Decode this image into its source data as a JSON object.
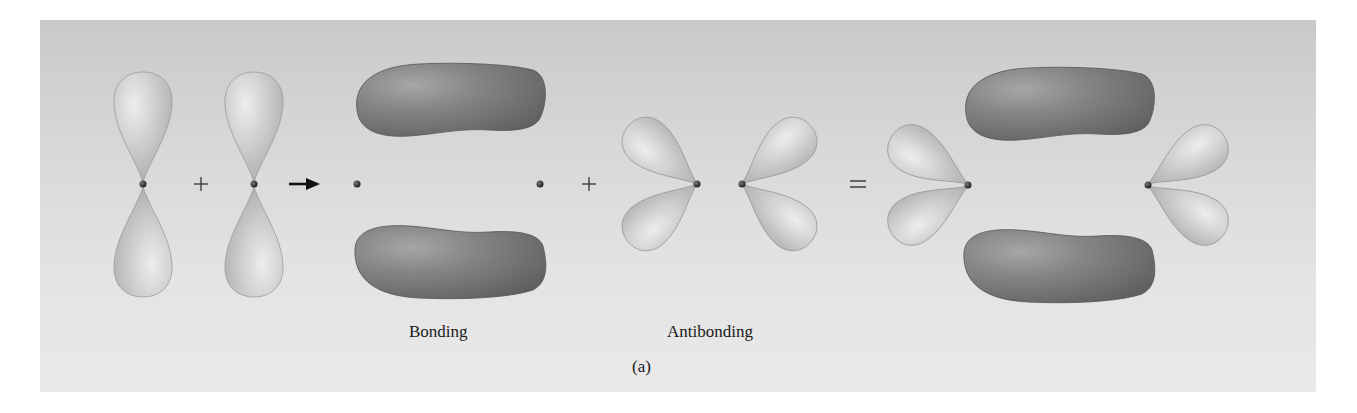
{
  "figure": {
    "panel_label": "(a)",
    "labels": {
      "bonding": "Bonding",
      "antibonding": "Antibonding"
    },
    "operators": {
      "plus_1": "+",
      "plus_2": "+",
      "equals": "="
    },
    "parts": [
      {
        "id": "p-orbital-1",
        "description": "vertical p orbital (two lobes) on atom 1"
      },
      {
        "id": "p-orbital-2",
        "description": "vertical p orbital (two lobes) on atom 2"
      },
      {
        "id": "bonding-pi",
        "description": "bonding pi molecular orbital, two dark elongated lobes above and below internuclear axis"
      },
      {
        "id": "antibonding-pi",
        "description": "antibonding pi* molecular orbital, four light lobes pointing outward"
      },
      {
        "id": "combined",
        "description": "combined bonding + antibonding orbitals"
      }
    ],
    "colors": {
      "background_top": "#c9c9c9",
      "background_bottom": "#e9e9e9",
      "light_lobe": "#c4c4c4",
      "dark_lobe": "#7a7a7a",
      "nucleus": "#2a2a2a"
    }
  }
}
